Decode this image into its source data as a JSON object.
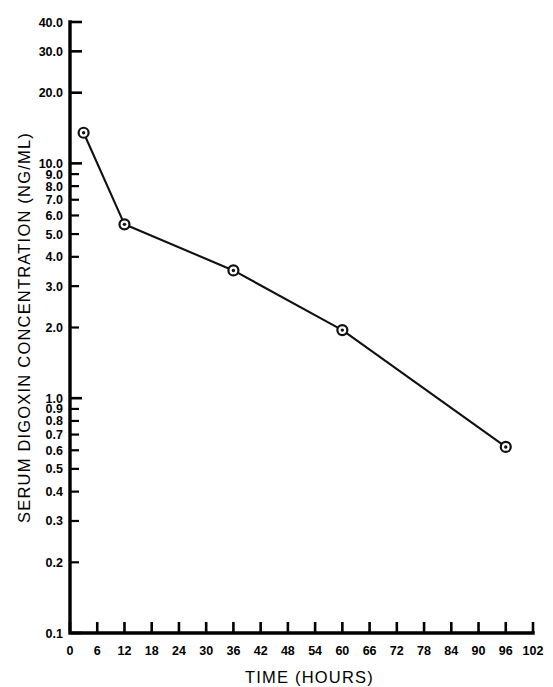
{
  "chart_data": {
    "type": "line",
    "title": "",
    "xlabel": "TIME (HOURS)",
    "ylabel": "SERUM DIGOXIN CONCENTRATION (NG/ML)",
    "yscale": "log",
    "ylim": [
      0.1,
      40.0
    ],
    "xlim": [
      0,
      102
    ],
    "grid": false,
    "legend": null,
    "x": [
      3,
      12,
      36,
      60,
      96
    ],
    "values": [
      13.5,
      5.5,
      3.5,
      1.95,
      0.62
    ],
    "series": [
      {
        "name": "serum digoxin concentration",
        "x": [
          3,
          12,
          36,
          60,
          96
        ],
        "values": [
          13.5,
          5.5,
          3.5,
          1.95,
          0.62
        ]
      }
    ],
    "marker": "circle-dot",
    "xticks": [
      0,
      6,
      12,
      18,
      24,
      30,
      36,
      42,
      48,
      54,
      60,
      66,
      72,
      78,
      84,
      90,
      96,
      102
    ],
    "xtick_labels": [
      "0",
      "6",
      "12",
      "18",
      "24",
      "30",
      "36",
      "42",
      "48",
      "54",
      "60",
      "66",
      "72",
      "78",
      "84",
      "90",
      "96",
      "102"
    ],
    "yticks": [
      40.0,
      30.0,
      20.0,
      10.0,
      9.0,
      8.0,
      7.0,
      6.0,
      5.0,
      4.0,
      3.0,
      2.0,
      1.0,
      0.9,
      0.8,
      0.7,
      0.6,
      0.5,
      0.4,
      0.3,
      0.2,
      0.1
    ],
    "ytick_labels": [
      "40.0",
      "30.0",
      "20.0",
      "10.0",
      "9.0",
      "8.0",
      "7.0",
      "6.0",
      "5.0",
      "4.0",
      "3.0",
      "2.0",
      "1.0",
      "0.9",
      "0.8",
      "0.7",
      "0.6",
      "0.5",
      "0.4",
      "0.3",
      "0.2",
      "0.1"
    ],
    "colors": {
      "line": "#111111",
      "marker_fill": "#ffffff",
      "marker_edge": "#111111",
      "axis": "#000000"
    }
  }
}
